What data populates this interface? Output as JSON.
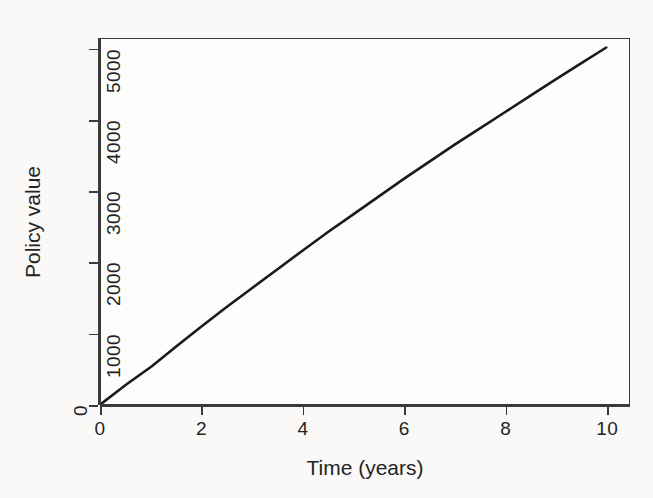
{
  "chart_data": {
    "type": "line",
    "title": "",
    "xlabel": "Time (years)",
    "ylabel": "Policy value",
    "xlim": [
      0,
      10.45
    ],
    "ylim": [
      0,
      5150
    ],
    "grid": false,
    "legend": "none",
    "xticks": [
      {
        "value": 0,
        "label": "0"
      },
      {
        "value": 2,
        "label": "2"
      },
      {
        "value": 4,
        "label": "4"
      },
      {
        "value": 6,
        "label": "6"
      },
      {
        "value": 8,
        "label": "8"
      },
      {
        "value": 10,
        "label": "10"
      }
    ],
    "yticks": [
      {
        "value": 0,
        "label": "0"
      },
      {
        "value": 1000,
        "label": "1000"
      },
      {
        "value": 2000,
        "label": "2000"
      },
      {
        "value": 3000,
        "label": "3000"
      },
      {
        "value": 4000,
        "label": "4000"
      },
      {
        "value": 5000,
        "label": "5000"
      }
    ],
    "series": [
      {
        "name": "Policy value",
        "color": "#1a1a1a",
        "line_width": 2.6,
        "x": [
          0,
          0.5,
          1,
          1.5,
          2,
          2.5,
          3,
          3.5,
          4,
          4.5,
          5,
          5.5,
          6,
          6.5,
          7,
          7.5,
          8,
          8.5,
          9,
          9.5,
          10
        ],
        "values": [
          0,
          275,
          530,
          820,
          1100,
          1375,
          1640,
          1905,
          2170,
          2430,
          2680,
          2930,
          3180,
          3420,
          3660,
          3890,
          4120,
          4350,
          4580,
          4805,
          5030
        ]
      }
    ]
  },
  "figure": {
    "background_color": "#faf9f7",
    "plot_background_color": "#fdfdfc",
    "frame_color": "#3a3a3a",
    "tick_label_color": "#242424"
  }
}
